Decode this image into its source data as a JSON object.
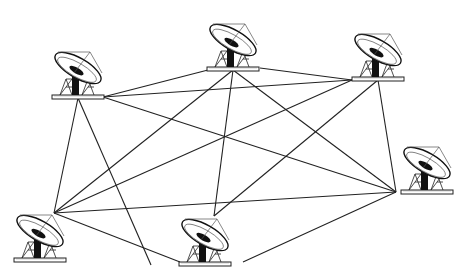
{
  "diagram": {
    "type": "mesh-network",
    "colors": {
      "line": "#222222",
      "background": "#ffffff"
    },
    "nodes": [
      {
        "id": "A",
        "name": "antenna-top-left",
        "x": 78,
        "y": 98
      },
      {
        "id": "B",
        "name": "antenna-top-center",
        "x": 233,
        "y": 70
      },
      {
        "id": "C",
        "name": "antenna-top-right",
        "x": 378,
        "y": 80
      },
      {
        "id": "D",
        "name": "antenna-right",
        "x": 396,
        "y": 192
      },
      {
        "id": "E",
        "name": "antenna-bottom-left",
        "x": 54,
        "y": 213
      },
      {
        "id": "F",
        "name": "antenna-bottom-center",
        "x": 214,
        "y": 216
      }
    ],
    "links": [
      [
        "A",
        "B"
      ],
      [
        "A",
        "C"
      ],
      [
        "A",
        "D"
      ],
      [
        "A",
        "E"
      ],
      [
        "A",
        "F"
      ],
      [
        "B",
        "C"
      ],
      [
        "B",
        "D"
      ],
      [
        "B",
        "E"
      ],
      [
        "B",
        "F"
      ],
      [
        "C",
        "D"
      ],
      [
        "C",
        "E"
      ],
      [
        "C",
        "F"
      ],
      [
        "D",
        "E"
      ],
      [
        "D",
        "F"
      ],
      [
        "E",
        "F"
      ]
    ]
  }
}
